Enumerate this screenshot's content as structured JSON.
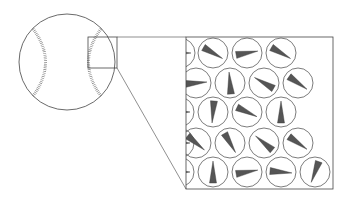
{
  "diagram": {
    "colors": {
      "stroke": "#444444",
      "wedge": "#555555",
      "stitch": "#777777",
      "background": "#ffffff"
    },
    "ball": {
      "cx": 67,
      "cy": 62,
      "r": 48
    },
    "zoom_box": {
      "x": 88,
      "y": 37,
      "w": 29,
      "h": 31
    },
    "detail_box": {
      "x": 186,
      "y": 37,
      "w": 147,
      "h": 152
    },
    "domain_radius": 15,
    "domains": [
      {
        "cx": 180,
        "cy": 53,
        "a": 0
      },
      {
        "cx": 213,
        "cy": 53,
        "a": 30
      },
      {
        "cx": 247,
        "cy": 53,
        "a": -10
      },
      {
        "cx": 281,
        "cy": 53,
        "a": 30
      },
      {
        "cx": 196,
        "cy": 83,
        "a": -5
      },
      {
        "cx": 230,
        "cy": 83,
        "a": -95
      },
      {
        "cx": 264,
        "cy": 83,
        "a": -150
      },
      {
        "cx": 298,
        "cy": 83,
        "a": 35
      },
      {
        "cx": 179,
        "cy": 112,
        "a": 0
      },
      {
        "cx": 213,
        "cy": 112,
        "a": 95
      },
      {
        "cx": 247,
        "cy": 112,
        "a": 25
      },
      {
        "cx": 281,
        "cy": 112,
        "a": -90
      },
      {
        "cx": 179,
        "cy": 143,
        "a": 0
      },
      {
        "cx": 196,
        "cy": 143,
        "a": 40
      },
      {
        "cx": 230,
        "cy": 143,
        "a": 60
      },
      {
        "cx": 264,
        "cy": 143,
        "a": -140
      },
      {
        "cx": 298,
        "cy": 143,
        "a": 35
      },
      {
        "cx": 179,
        "cy": 172,
        "a": 0
      },
      {
        "cx": 213,
        "cy": 172,
        "a": -90
      },
      {
        "cx": 247,
        "cy": 172,
        "a": -10
      },
      {
        "cx": 281,
        "cy": 172,
        "a": 5
      },
      {
        "cx": 315,
        "cy": 172,
        "a": 110
      }
    ]
  }
}
